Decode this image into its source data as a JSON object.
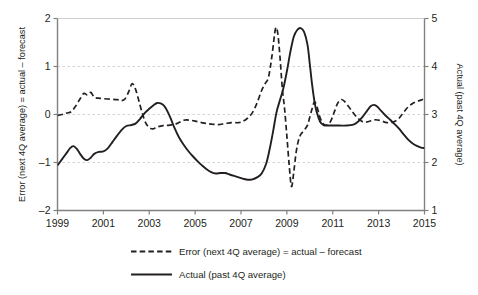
{
  "chart_data": {
    "type": "line",
    "title": "",
    "xlabel": "",
    "ylabel": "Error (next 4Q average) = actual – forecast",
    "y2label": "Actual (past 4Q average)",
    "grid": true,
    "legend_position": "bottom",
    "xlim": [
      1999,
      2015
    ],
    "ylim": [
      -2,
      2
    ],
    "y2lim": [
      1,
      5
    ],
    "xticks": [
      1999,
      2001,
      2003,
      2005,
      2007,
      2009,
      2011,
      2013,
      2015
    ],
    "xticklabels": [
      "1999",
      "2001",
      "2003",
      "2005",
      "2007",
      "2009",
      "2011",
      "2013",
      "2015"
    ],
    "yticks": [
      -2,
      -1,
      0,
      1,
      2
    ],
    "yticklabels": [
      "–2",
      "–1",
      "0",
      "1",
      "2"
    ],
    "y2ticks": [
      1,
      2,
      3,
      4,
      5
    ],
    "y2ticklabels": [
      "1",
      "2",
      "3",
      "4",
      "5"
    ],
    "gridlines_y": [
      -1,
      0,
      1
    ],
    "series": [
      {
        "name": "Error (next 4Q average) = actual – forecast",
        "axis": "left",
        "style": "dashed",
        "color": "#231f20",
        "points": [
          [
            1999.0,
            -0.02
          ],
          [
            1999.2,
            0.0
          ],
          [
            1999.4,
            0.03
          ],
          [
            1999.6,
            0.06
          ],
          [
            1999.8,
            0.18
          ],
          [
            2000.0,
            0.34
          ],
          [
            2000.15,
            0.44
          ],
          [
            2000.3,
            0.41
          ],
          [
            2000.45,
            0.46
          ],
          [
            2000.6,
            0.36
          ],
          [
            2000.8,
            0.34
          ],
          [
            2001.0,
            0.33
          ],
          [
            2001.3,
            0.32
          ],
          [
            2001.6,
            0.31
          ],
          [
            2001.8,
            0.29
          ],
          [
            2001.95,
            0.33
          ],
          [
            2002.1,
            0.47
          ],
          [
            2002.25,
            0.64
          ],
          [
            2002.4,
            0.53
          ],
          [
            2002.55,
            0.28
          ],
          [
            2002.7,
            0.02
          ],
          [
            2002.85,
            -0.18
          ],
          [
            2003.0,
            -0.27
          ],
          [
            2003.15,
            -0.3
          ],
          [
            2003.35,
            -0.26
          ],
          [
            2003.6,
            -0.23
          ],
          [
            2003.9,
            -0.22
          ],
          [
            2004.2,
            -0.19
          ],
          [
            2004.5,
            -0.12
          ],
          [
            2004.8,
            -0.12
          ],
          [
            2005.1,
            -0.15
          ],
          [
            2005.4,
            -0.18
          ],
          [
            2005.7,
            -0.2
          ],
          [
            2006.0,
            -0.21
          ],
          [
            2006.3,
            -0.19
          ],
          [
            2006.6,
            -0.17
          ],
          [
            2006.9,
            -0.17
          ],
          [
            2007.1,
            -0.14
          ],
          [
            2007.3,
            -0.07
          ],
          [
            2007.5,
            0.04
          ],
          [
            2007.7,
            0.24
          ],
          [
            2007.9,
            0.5
          ],
          [
            2008.05,
            0.64
          ],
          [
            2008.2,
            0.78
          ],
          [
            2008.35,
            1.22
          ],
          [
            2008.5,
            1.78
          ],
          [
            2008.6,
            1.7
          ],
          [
            2008.7,
            1.2
          ],
          [
            2008.8,
            0.55
          ],
          [
            2008.9,
            0.12
          ],
          [
            2009.0,
            -0.45
          ],
          [
            2009.1,
            -1.05
          ],
          [
            2009.2,
            -1.5
          ],
          [
            2009.3,
            -1.2
          ],
          [
            2009.4,
            -0.8
          ],
          [
            2009.5,
            -0.55
          ],
          [
            2009.6,
            -0.42
          ],
          [
            2009.75,
            -0.33
          ],
          [
            2009.9,
            -0.22
          ],
          [
            2010.0,
            -0.05
          ],
          [
            2010.1,
            0.12
          ],
          [
            2010.2,
            0.26
          ],
          [
            2010.3,
            0.18
          ],
          [
            2010.45,
            -0.07
          ],
          [
            2010.6,
            -0.2
          ],
          [
            2010.75,
            -0.22
          ],
          [
            2010.9,
            -0.15
          ],
          [
            2011.05,
            0.03
          ],
          [
            2011.2,
            0.22
          ],
          [
            2011.35,
            0.31
          ],
          [
            2011.5,
            0.28
          ],
          [
            2011.7,
            0.16
          ],
          [
            2011.9,
            0.03
          ],
          [
            2012.1,
            -0.08
          ],
          [
            2012.35,
            -0.16
          ],
          [
            2012.6,
            -0.14
          ],
          [
            2012.85,
            -0.11
          ],
          [
            2013.1,
            -0.13
          ],
          [
            2013.35,
            -0.17
          ],
          [
            2013.6,
            -0.16
          ],
          [
            2013.85,
            -0.1
          ],
          [
            2014.05,
            0.02
          ],
          [
            2014.25,
            0.14
          ],
          [
            2014.45,
            0.22
          ],
          [
            2014.65,
            0.27
          ],
          [
            2014.85,
            0.3
          ],
          [
            2015.0,
            0.33
          ]
        ]
      },
      {
        "name": "Actual (past 4Q average)",
        "axis": "left",
        "style": "solid",
        "color": "#231f20",
        "points": [
          [
            1999.0,
            -1.06
          ],
          [
            1999.2,
            -0.93
          ],
          [
            1999.4,
            -0.8
          ],
          [
            1999.55,
            -0.7
          ],
          [
            1999.7,
            -0.66
          ],
          [
            1999.85,
            -0.72
          ],
          [
            2000.0,
            -0.83
          ],
          [
            2000.15,
            -0.92
          ],
          [
            2000.3,
            -0.95
          ],
          [
            2000.45,
            -0.9
          ],
          [
            2000.6,
            -0.82
          ],
          [
            2000.8,
            -0.78
          ],
          [
            2001.0,
            -0.77
          ],
          [
            2001.2,
            -0.7
          ],
          [
            2001.4,
            -0.57
          ],
          [
            2001.6,
            -0.44
          ],
          [
            2001.8,
            -0.32
          ],
          [
            2002.0,
            -0.24
          ],
          [
            2002.2,
            -0.22
          ],
          [
            2002.4,
            -0.19
          ],
          [
            2002.6,
            -0.09
          ],
          [
            2002.8,
            0.03
          ],
          [
            2003.0,
            0.12
          ],
          [
            2003.2,
            0.2
          ],
          [
            2003.35,
            0.24
          ],
          [
            2003.5,
            0.23
          ],
          [
            2003.65,
            0.18
          ],
          [
            2003.8,
            0.06
          ],
          [
            2003.95,
            -0.1
          ],
          [
            2004.1,
            -0.28
          ],
          [
            2004.3,
            -0.48
          ],
          [
            2004.5,
            -0.63
          ],
          [
            2004.7,
            -0.76
          ],
          [
            2004.9,
            -0.87
          ],
          [
            2005.1,
            -0.97
          ],
          [
            2005.3,
            -1.06
          ],
          [
            2005.5,
            -1.14
          ],
          [
            2005.7,
            -1.2
          ],
          [
            2005.9,
            -1.23
          ],
          [
            2006.1,
            -1.22
          ],
          [
            2006.3,
            -1.22
          ],
          [
            2006.5,
            -1.25
          ],
          [
            2006.7,
            -1.28
          ],
          [
            2006.9,
            -1.31
          ],
          [
            2007.1,
            -1.34
          ],
          [
            2007.3,
            -1.36
          ],
          [
            2007.5,
            -1.35
          ],
          [
            2007.7,
            -1.31
          ],
          [
            2007.9,
            -1.23
          ],
          [
            2008.1,
            -1.02
          ],
          [
            2008.25,
            -0.72
          ],
          [
            2008.4,
            -0.35
          ],
          [
            2008.55,
            0.05
          ],
          [
            2008.7,
            0.3
          ],
          [
            2008.85,
            0.55
          ],
          [
            2009.0,
            0.9
          ],
          [
            2009.15,
            1.3
          ],
          [
            2009.3,
            1.62
          ],
          [
            2009.45,
            1.76
          ],
          [
            2009.6,
            1.8
          ],
          [
            2009.75,
            1.72
          ],
          [
            2009.9,
            1.45
          ],
          [
            2010.0,
            1.05
          ],
          [
            2010.1,
            0.62
          ],
          [
            2010.2,
            0.28
          ],
          [
            2010.3,
            0.05
          ],
          [
            2010.45,
            -0.15
          ],
          [
            2010.6,
            -0.22
          ],
          [
            2010.8,
            -0.23
          ],
          [
            2011.0,
            -0.23
          ],
          [
            2011.3,
            -0.23
          ],
          [
            2011.6,
            -0.23
          ],
          [
            2011.9,
            -0.21
          ],
          [
            2012.1,
            -0.15
          ],
          [
            2012.3,
            -0.05
          ],
          [
            2012.5,
            0.08
          ],
          [
            2012.65,
            0.17
          ],
          [
            2012.8,
            0.2
          ],
          [
            2012.95,
            0.16
          ],
          [
            2013.1,
            0.08
          ],
          [
            2013.3,
            -0.02
          ],
          [
            2013.5,
            -0.11
          ],
          [
            2013.7,
            -0.2
          ],
          [
            2013.9,
            -0.3
          ],
          [
            2014.1,
            -0.42
          ],
          [
            2014.3,
            -0.53
          ],
          [
            2014.5,
            -0.61
          ],
          [
            2014.7,
            -0.66
          ],
          [
            2014.85,
            -0.69
          ],
          [
            2015.0,
            -0.7
          ]
        ]
      }
    ]
  },
  "legend": {
    "items": [
      {
        "label": "Error (next 4Q average) = actual – forecast",
        "style": "dashed"
      },
      {
        "label": "Actual (past 4Q average)",
        "style": "solid"
      }
    ]
  },
  "colors": {
    "line": "#231f20",
    "grid": "#cfcfcf",
    "axis": "#808080",
    "background": "#ffffff"
  }
}
